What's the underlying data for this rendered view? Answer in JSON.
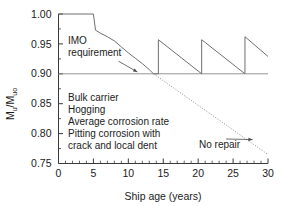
{
  "chart_data": {
    "type": "line",
    "title": "",
    "xlabel": "Ship age (years)",
    "ylabel": "Mu/Muo",
    "ylabel_parts": {
      "base1": "M",
      "sub1": "u",
      "slash": "/",
      "base2": "M",
      "sub2": "uo"
    },
    "xlim": [
      0,
      30
    ],
    "ylim": [
      0.75,
      1.0
    ],
    "x_ticks": [
      0,
      5,
      10,
      15,
      20,
      25,
      30
    ],
    "x_tick_labels": [
      "0",
      "5",
      "10",
      "15",
      "20",
      "25",
      "30"
    ],
    "x_minor_step": 1,
    "y_ticks": [
      0.75,
      0.8,
      0.85,
      0.9,
      0.95,
      1.0
    ],
    "y_tick_labels": [
      "0.75",
      "0.80",
      "0.85",
      "0.90",
      "0.95",
      "1.00"
    ],
    "y_minor_step": 0.025,
    "grid": false,
    "legend": "none",
    "series": [
      {
        "name": "Strength with repair (sawtooth)",
        "style": "solid",
        "color": "#6f6f6f",
        "points": [
          [
            0.0,
            1.0
          ],
          [
            5.0,
            1.0
          ],
          [
            5.3,
            0.973
          ],
          [
            6.0,
            0.968
          ],
          [
            7.0,
            0.962
          ],
          [
            8.0,
            0.955
          ],
          [
            9.0,
            0.945
          ],
          [
            10.0,
            0.935
          ],
          [
            11.0,
            0.926
          ],
          [
            12.0,
            0.917
          ],
          [
            13.0,
            0.907
          ],
          [
            13.6,
            0.9
          ],
          [
            14.3,
            0.9
          ],
          [
            14.3,
            0.957
          ],
          [
            20.5,
            0.9
          ],
          [
            20.5,
            0.957
          ],
          [
            26.7,
            0.9
          ],
          [
            26.7,
            0.962
          ],
          [
            30.0,
            0.929
          ]
        ]
      },
      {
        "name": "No repair (extrapolated)",
        "style": "dotted",
        "color": "#8a8a8a",
        "points": [
          [
            13.6,
            0.9
          ],
          [
            30.0,
            0.765
          ]
        ]
      },
      {
        "name": "IMO requirement level",
        "style": "solid-thin",
        "color": "#8a8a8a",
        "points": [
          [
            0.0,
            0.9
          ],
          [
            30.0,
            0.9
          ]
        ]
      }
    ],
    "reference_lines": [
      {
        "name": "imo-requirement",
        "orientation": "horizontal",
        "value": 0.9
      }
    ],
    "annotations": [
      {
        "name": "imo-requirement-label",
        "lines": [
          "IMO",
          "requirement"
        ],
        "x": 1.0,
        "y": 0.952,
        "leader_to": [
          11.3,
          0.903
        ]
      },
      {
        "name": "condition-note",
        "lines": [
          "Bulk carrier",
          "Hogging",
          "Average corrosion rate",
          "Pitting corrosion with",
          "crack and local dent"
        ],
        "x": 1.0,
        "y": 0.858
      },
      {
        "name": "no-repair-label",
        "text": "No repair",
        "x": 20.2,
        "y": 0.782,
        "leader_to": [
          27.8,
          0.79
        ]
      }
    ]
  },
  "colors": {
    "background": "#ffffff",
    "axis": "#3a3a3a",
    "series": "#6f6f6f",
    "reference": "#8a8a8a",
    "text": "#1a1a1a"
  }
}
